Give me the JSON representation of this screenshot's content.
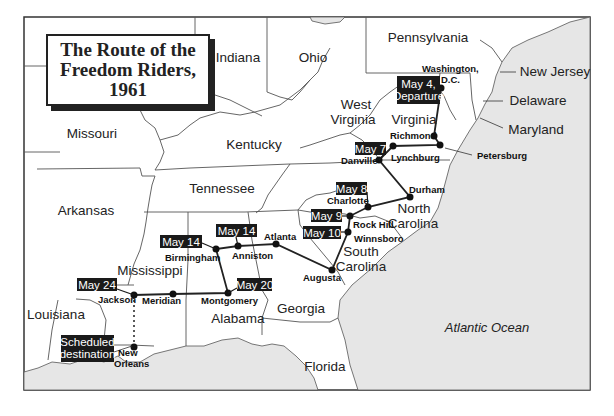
{
  "title": {
    "line1": "The Route of the",
    "line2": "Freedom Riders,",
    "line3": "1961"
  },
  "colors": {
    "land": "#ffffff",
    "ocean": "#e6e6e6",
    "border": "#555555",
    "route": "#222222",
    "label_bg": "#1a1a1a"
  },
  "states": [
    {
      "name": "Missouri",
      "x": 92,
      "y": 138
    },
    {
      "name": "Indiana",
      "x": 238,
      "y": 62
    },
    {
      "name": "Ohio",
      "x": 313,
      "y": 62
    },
    {
      "name": "Pennsylvania",
      "x": 428,
      "y": 42
    },
    {
      "name": "New Jersey",
      "x": 529,
      "y": 72
    },
    {
      "name": "Delaware",
      "x": 515,
      "y": 101
    },
    {
      "name": "Maryland",
      "x": 507,
      "y": 130
    },
    {
      "name": "West",
      "x": 354,
      "y": 104
    },
    {
      "name": "Virginia",
      "x": 353,
      "y": 122
    },
    {
      "name": "Virginia",
      "x": 413,
      "y": 122
    },
    {
      "name": "Kentucky",
      "x": 254,
      "y": 146
    },
    {
      "name": "Tennessee",
      "x": 231,
      "y": 189
    },
    {
      "name": "Arkansas",
      "x": 86,
      "y": 211
    },
    {
      "name": "North",
      "x": 413,
      "y": 210
    },
    {
      "name": "Carolina",
      "x": 413,
      "y": 228
    },
    {
      "name": "South",
      "x": 359,
      "y": 252
    },
    {
      "name": "Carolina",
      "x": 359,
      "y": 270
    },
    {
      "name": "Mississippi",
      "x": 148,
      "y": 271
    },
    {
      "name": "Louisiana",
      "x": 60,
      "y": 316
    },
    {
      "name": "Alabama",
      "x": 237,
      "y": 319
    },
    {
      "name": "Georgia",
      "x": 302,
      "y": 309
    },
    {
      "name": "Florida",
      "x": 325,
      "y": 368
    }
  ],
  "ocean_label": "Atlantic Ocean",
  "cities": [
    {
      "name": "Washington,",
      "x": 472,
      "y": 71
    },
    {
      "name": "D.C.",
      "x": 451,
      "y": 81
    },
    {
      "name": "Richmond",
      "x": 422,
      "y": 138
    },
    {
      "name": "Petersburg",
      "x": 478,
      "y": 158
    },
    {
      "name": "Lynchburg",
      "x": 418,
      "y": 158
    },
    {
      "name": "Danville",
      "x": 373,
      "y": 163
    },
    {
      "name": "Durham",
      "x": 425,
      "y": 193
    },
    {
      "name": "Charlotte",
      "x": 355,
      "y": 204
    },
    {
      "name": "Rock Hill",
      "x": 371,
      "y": 224
    },
    {
      "name": "Winnsboro",
      "x": 374,
      "y": 240
    },
    {
      "name": "Augusta",
      "x": 316,
      "y": 280
    },
    {
      "name": "Atlanta",
      "x": 279,
      "y": 238
    },
    {
      "name": "Anniston",
      "x": 251,
      "y": 258
    },
    {
      "name": "Birmingham",
      "x": 191,
      "y": 260
    },
    {
      "name": "Montgomery",
      "x": 227,
      "y": 303
    },
    {
      "name": "Meridian",
      "x": 162,
      "y": 303
    },
    {
      "name": "Jackson",
      "x": 102,
      "y": 302
    },
    {
      "name": "New",
      "x": 124,
      "y": 356
    },
    {
      "name": "Orleans",
      "x": 125,
      "y": 367
    }
  ],
  "route_stops": [
    {
      "name": "Washington, D.C.",
      "x": 441,
      "y": 88
    },
    {
      "name": "Richmond",
      "x": 434,
      "y": 136
    },
    {
      "name": "Petersburg",
      "x": 440,
      "y": 145
    },
    {
      "name": "Lynchburg",
      "x": 393,
      "y": 146
    },
    {
      "name": "Danville",
      "x": 379,
      "y": 160
    },
    {
      "name": "Durham",
      "x": 410,
      "y": 197
    },
    {
      "name": "Charlotte",
      "x": 368,
      "y": 207
    },
    {
      "name": "Rock Hill",
      "x": 350,
      "y": 216
    },
    {
      "name": "Winnsboro",
      "x": 348,
      "y": 232
    },
    {
      "name": "Augusta",
      "x": 332,
      "y": 270
    },
    {
      "name": "Atlanta",
      "x": 276,
      "y": 244
    },
    {
      "name": "Anniston",
      "x": 238,
      "y": 246
    },
    {
      "name": "Birmingham",
      "x": 216,
      "y": 249
    },
    {
      "name": "Montgomery",
      "x": 228,
      "y": 293
    },
    {
      "name": "Meridian",
      "x": 173,
      "y": 294
    },
    {
      "name": "Jackson",
      "x": 134,
      "y": 295
    },
    {
      "name": "New Orleans",
      "x": 134,
      "y": 347
    }
  ],
  "date_labels": [
    {
      "text1": "May 4,",
      "text2": "Departure",
      "x": 397,
      "y": 76,
      "w": 43,
      "h": 28
    },
    {
      "text1": "May 7",
      "x": 355,
      "y": 142,
      "w": 31,
      "h": 13
    },
    {
      "text1": "May 8",
      "x": 336,
      "y": 182,
      "w": 31,
      "h": 13
    },
    {
      "text1": "May 9",
      "x": 311,
      "y": 209,
      "w": 31,
      "h": 13
    },
    {
      "text1": "May 10",
      "x": 303,
      "y": 226,
      "w": 38,
      "h": 13
    },
    {
      "text1": "May 14",
      "x": 160,
      "y": 235,
      "w": 42,
      "h": 13
    },
    {
      "text1": "May 14",
      "x": 216,
      "y": 224,
      "w": 41,
      "h": 13
    },
    {
      "text1": "May 20",
      "x": 237,
      "y": 278,
      "w": 35,
      "h": 13
    },
    {
      "text1": "May 24",
      "x": 77,
      "y": 278,
      "w": 40,
      "h": 13
    },
    {
      "text1": "Scheduled",
      "text2": "destination",
      "x": 61,
      "y": 335,
      "w": 53,
      "h": 27
    }
  ]
}
